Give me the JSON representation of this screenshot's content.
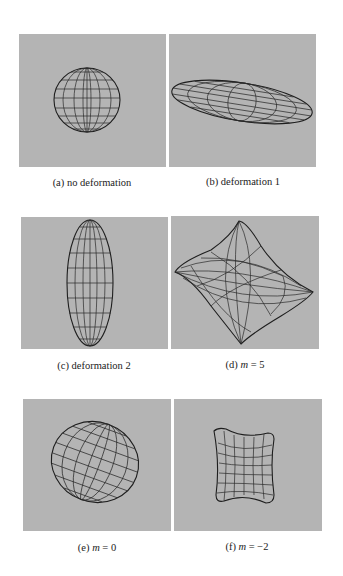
{
  "figure": {
    "panel_background": "#b4b4b4",
    "wire_color": "#2a2a2a",
    "panels": [
      {
        "id": "a",
        "label": "(a)",
        "caption": "no deformation",
        "shape": "sphere"
      },
      {
        "id": "b",
        "label": "(b)",
        "caption": "deformation 1",
        "shape": "flat-tilted-ellipsoid"
      },
      {
        "id": "c",
        "label": "(c)",
        "caption": "deformation 2",
        "shape": "tall-ellipsoid"
      },
      {
        "id": "d",
        "label": "(d)",
        "caption_var": "m",
        "caption_eq": " = 5",
        "shape": "diamond-superquadric"
      },
      {
        "id": "e",
        "label": "(e)",
        "caption_var": "m",
        "caption_eq": " = 0",
        "shape": "tilted-ellipsoid"
      },
      {
        "id": "f",
        "label": "(f)",
        "caption_var": "m",
        "caption_eq": " = −2",
        "shape": "concave-spool"
      }
    ]
  }
}
